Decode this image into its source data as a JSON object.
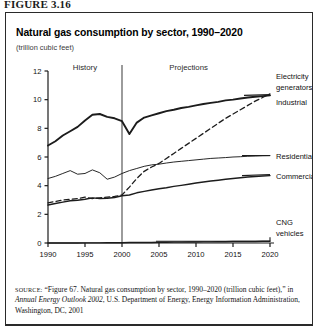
{
  "figure": {
    "label": "FIGURE 3.16",
    "title": "Natural gas consumption by sector, 1990–2020",
    "subtitle": "(trillion cubic feet)"
  },
  "source": {
    "keyword": "SOURCE:",
    "part1": " “Figure 67. Natural gas consumption by sector, 1990–2020 (trillion cubic feet),” in ",
    "italic": "Annual Energy Outlook 2002",
    "part2": ", U.S. Department of Energy, Energy Information Administration, Washington, DC, 2001"
  },
  "annotations": {
    "history": "History",
    "projections": "Projections",
    "divider_year": 2000
  },
  "chart_data": {
    "type": "line",
    "title": "Natural gas consumption by sector, 1990–2020",
    "subtitle": "(trillion cubic feet)",
    "xlabel": "",
    "ylabel": "",
    "xlim": [
      1990,
      2020
    ],
    "ylim": [
      0,
      12
    ],
    "ytick_labels": [
      "0",
      "2",
      "4",
      "6",
      "8",
      "10",
      "12"
    ],
    "yticks": [
      0,
      2,
      4,
      6,
      8,
      10,
      12
    ],
    "xtick_labels": [
      "1990",
      "1995",
      "2000",
      "2005",
      "2010",
      "2015",
      "2020"
    ],
    "xticks": [
      1990,
      1995,
      2000,
      2005,
      2010,
      2015,
      2020
    ],
    "grid": false,
    "legend_position": "right-inline",
    "x": [
      1990,
      1991,
      1992,
      1993,
      1994,
      1995,
      1996,
      1997,
      1998,
      1999,
      2000,
      2001,
      2002,
      2003,
      2004,
      2005,
      2006,
      2007,
      2008,
      2009,
      2010,
      2011,
      2012,
      2013,
      2014,
      2015,
      2016,
      2017,
      2018,
      2019,
      2020
    ],
    "series": [
      {
        "name": "Industrial",
        "label": "Industrial",
        "style": "solid-thick",
        "values": [
          6.8,
          7.1,
          7.5,
          7.8,
          8.1,
          8.55,
          8.95,
          9.0,
          8.8,
          8.7,
          8.5,
          7.6,
          8.4,
          8.75,
          8.9,
          9.05,
          9.2,
          9.3,
          9.42,
          9.5,
          9.6,
          9.7,
          9.78,
          9.85,
          9.95,
          10.0,
          10.08,
          10.15,
          10.2,
          10.25,
          10.3
        ]
      },
      {
        "name": "Electricity generators",
        "label": "Electricity generators",
        "style": "dashed",
        "values": [
          2.8,
          2.9,
          3.0,
          3.05,
          3.1,
          3.2,
          3.1,
          3.15,
          3.2,
          3.25,
          3.35,
          3.9,
          4.5,
          5.0,
          5.3,
          5.55,
          5.9,
          6.25,
          6.6,
          6.95,
          7.3,
          7.65,
          8.0,
          8.35,
          8.7,
          9.0,
          9.3,
          9.6,
          9.9,
          10.15,
          10.4
        ]
      },
      {
        "name": "Residential",
        "label": "Residential",
        "style": "solid-thin",
        "values": [
          4.5,
          4.65,
          4.85,
          5.05,
          4.8,
          4.85,
          5.1,
          4.9,
          4.45,
          4.6,
          4.85,
          5.05,
          5.2,
          5.35,
          5.45,
          5.5,
          5.58,
          5.65,
          5.7,
          5.75,
          5.8,
          5.85,
          5.9,
          5.93,
          5.96,
          6.0,
          6.02,
          6.05,
          6.07,
          6.09,
          6.1
        ]
      },
      {
        "name": "Commercial",
        "label": "Commercial",
        "style": "solid-med",
        "values": [
          2.65,
          2.75,
          2.85,
          2.95,
          2.98,
          3.05,
          3.15,
          3.1,
          3.12,
          3.18,
          3.3,
          3.35,
          3.5,
          3.6,
          3.7,
          3.78,
          3.85,
          3.95,
          4.02,
          4.1,
          4.18,
          4.25,
          4.32,
          4.38,
          4.45,
          4.5,
          4.55,
          4.6,
          4.64,
          4.67,
          4.7
        ]
      },
      {
        "name": "CNG vehicles",
        "label": "CNG vehicles",
        "style": "solid-med",
        "values": [
          0.0,
          0.0,
          0.0,
          0.0,
          0.0,
          0.01,
          0.01,
          0.01,
          0.02,
          0.02,
          0.02,
          0.03,
          0.03,
          0.04,
          0.04,
          0.05,
          0.05,
          0.06,
          0.06,
          0.07,
          0.07,
          0.08,
          0.08,
          0.09,
          0.09,
          0.1,
          0.1,
          0.11,
          0.11,
          0.12,
          0.12
        ]
      }
    ],
    "annotations": [
      {
        "text": "History",
        "x": 1995
      },
      {
        "text": "Projections",
        "x": 2009
      }
    ],
    "right_labels": [
      "Electricity generators",
      "Industrial",
      "Residential",
      "Commercial",
      "CNG vehicles"
    ]
  }
}
